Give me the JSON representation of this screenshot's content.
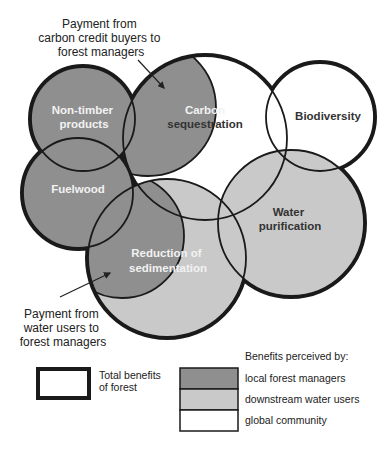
{
  "colors": {
    "local_forest_managers": "#8f8f8f",
    "downstream_water_users": "#c9c9c9",
    "global_community": "#ffffff",
    "outline": "#1a1a1a"
  },
  "annotations": {
    "carbon_payment": [
      "Payment from",
      "carbon credit buyers to",
      "forest managers"
    ],
    "water_payment": [
      "Payment from",
      "water users to",
      "forest managers"
    ]
  },
  "circles": [
    {
      "id": "non_timber",
      "label_lines": [
        "Non-timber",
        "products"
      ],
      "perceived_by": "local forest managers"
    },
    {
      "id": "carbon",
      "label_lines": [
        "Carbon",
        "sequestration"
      ],
      "perceived_by": "global community"
    },
    {
      "id": "biodiversity",
      "label_lines": [
        "Biodiversity"
      ],
      "perceived_by": "global community"
    },
    {
      "id": "fuelwood",
      "label_lines": [
        "Fuelwood"
      ],
      "perceived_by": "local forest managers"
    },
    {
      "id": "water",
      "label_lines": [
        "Water",
        "purification"
      ],
      "perceived_by": "downstream water users"
    },
    {
      "id": "sedimentation",
      "label_lines": [
        "Reduction of",
        "sedimentation"
      ],
      "perceived_by": "downstream water users"
    }
  ],
  "labels": {
    "non_timber_1": "Non-timber",
    "non_timber_2": "products",
    "carbon_1": "Carbon",
    "carbon_2": "sequestration",
    "biodiversity": "Biodiversity",
    "fuelwood": "Fuelwood",
    "water_1": "Water",
    "water_2": "purification",
    "sed_1": "Reduction of",
    "sed_2": "sedimentation",
    "carbon_pay_1": "Payment from",
    "carbon_pay_2": "carbon credit buyers to",
    "carbon_pay_3": "forest managers",
    "water_pay_1": "Payment from",
    "water_pay_2": "water users to",
    "water_pay_3": "forest managers"
  },
  "legend": {
    "total_label_1": "Total benefits",
    "total_label_2": "of forest",
    "perceived_title": "Benefits perceived by:",
    "items": [
      {
        "label": "local forest managers",
        "color": "#8f8f8f"
      },
      {
        "label": "downstream water users",
        "color": "#c9c9c9"
      },
      {
        "label": "global community",
        "color": "#ffffff"
      }
    ]
  }
}
